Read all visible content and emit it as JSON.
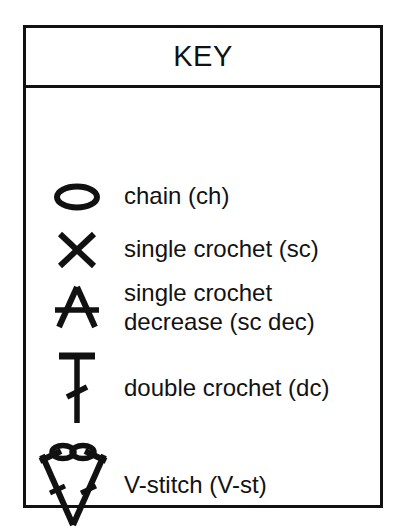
{
  "panel": {
    "title": "KEY",
    "stroke_color": "#111111",
    "background_color": "#ffffff",
    "text_color": "#121212"
  },
  "rows": [
    {
      "symbol_name": "chain-symbol",
      "symbol_glyph": "oval",
      "label_lines": [
        "chain (ch)"
      ]
    },
    {
      "symbol_name": "single-crochet-symbol",
      "symbol_glyph": "x-cross",
      "label_lines": [
        "single crochet (sc)"
      ]
    },
    {
      "symbol_name": "single-crochet-decrease-symbol",
      "symbol_glyph": "inverted-v-with-bar",
      "label_lines": [
        "single crochet",
        "decrease (sc dec)"
      ]
    },
    {
      "symbol_name": "double-crochet-symbol",
      "symbol_glyph": "t-stem-with-slash",
      "label_lines": [
        "double crochet (dc)"
      ]
    },
    {
      "symbol_name": "v-stitch-symbol",
      "symbol_glyph": "v-with-two-ovals",
      "label_lines": [
        "V-stitch (V-st)"
      ]
    }
  ]
}
